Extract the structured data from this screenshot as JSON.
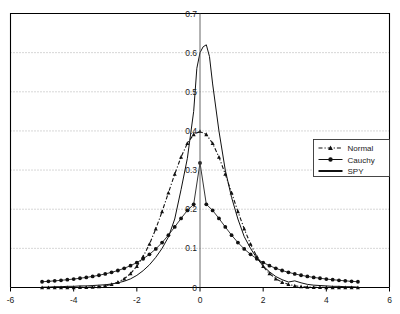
{
  "chart_data": {
    "type": "line",
    "title": "",
    "subtitle": "",
    "xlabel": "",
    "ylabel": "",
    "xlim": [
      -6,
      6
    ],
    "ylim": [
      0,
      0.7
    ],
    "xticks": [
      "-6",
      "-4",
      "-2",
      "0",
      "2",
      "4",
      "6"
    ],
    "xtick_values": [
      -6,
      -4,
      -2,
      0,
      2,
      4,
      6
    ],
    "yticks": [
      "0",
      "0.1",
      "0.2",
      "0.3",
      "0.4",
      "0.5",
      "0.6",
      "0.7"
    ],
    "ytick_values": [
      0,
      0.1,
      0.2,
      0.3,
      0.4,
      0.5,
      0.6,
      0.7
    ],
    "grid": "horizontal-dotted",
    "legend_position": "right",
    "legend_entries": [
      "Normal",
      "Cauchy",
      "SPY"
    ],
    "series": [
      {
        "name": "Normal",
        "style": "dash-dot-with-triangle-markers",
        "x": [
          -5.0,
          -4.8,
          -4.6,
          -4.4,
          -4.2,
          -4.0,
          -3.8,
          -3.6,
          -3.4,
          -3.2,
          -3.0,
          -2.8,
          -2.6,
          -2.4,
          -2.2,
          -2.0,
          -1.8,
          -1.6,
          -1.4,
          -1.2,
          -1.0,
          -0.8,
          -0.6,
          -0.4,
          -0.2,
          0.0,
          0.2,
          0.4,
          0.6,
          0.8,
          1.0,
          1.2,
          1.4,
          1.6,
          1.8,
          2.0,
          2.2,
          2.4,
          2.6,
          2.8,
          3.0,
          3.2,
          3.4,
          3.6,
          3.8,
          4.0,
          4.2,
          4.4,
          4.6,
          4.8,
          5.0
        ],
        "y": [
          1e-06,
          3e-06,
          6e-06,
          1.5e-05,
          3.3e-05,
          6.7e-05,
          0.00029,
          0.0006,
          0.0012,
          0.0024,
          0.0044,
          0.0079,
          0.0136,
          0.0224,
          0.0355,
          0.054,
          0.079,
          0.1109,
          0.1497,
          0.1942,
          0.242,
          0.2897,
          0.3332,
          0.3683,
          0.391,
          0.3989,
          0.391,
          0.3683,
          0.3332,
          0.2897,
          0.242,
          0.1942,
          0.1497,
          0.1109,
          0.079,
          0.054,
          0.0355,
          0.0224,
          0.0136,
          0.0079,
          0.0044,
          0.0024,
          0.0012,
          0.0006,
          0.00029,
          0.000134,
          6.7e-05,
          3.3e-05,
          1.5e-05,
          6e-06,
          3e-06
        ]
      },
      {
        "name": "Cauchy",
        "style": "solid-with-filled-circle-markers",
        "x": [
          -5.0,
          -4.8,
          -4.6,
          -4.4,
          -4.2,
          -4.0,
          -3.8,
          -3.6,
          -3.4,
          -3.2,
          -3.0,
          -2.8,
          -2.6,
          -2.4,
          -2.2,
          -2.0,
          -1.8,
          -1.6,
          -1.4,
          -1.2,
          -1.0,
          -0.8,
          -0.6,
          -0.4,
          -0.2,
          0.0,
          0.2,
          0.4,
          0.6,
          0.8,
          1.0,
          1.2,
          1.4,
          1.6,
          1.8,
          2.0,
          2.2,
          2.4,
          2.6,
          2.8,
          3.0,
          3.2,
          3.4,
          3.6,
          3.8,
          4.0,
          4.2,
          4.4,
          4.6,
          4.8,
          5.0
        ],
        "y": [
          0.0147,
          0.0158,
          0.017,
          0.0184,
          0.0199,
          0.0216,
          0.0236,
          0.0258,
          0.0283,
          0.0313,
          0.0347,
          0.0387,
          0.0434,
          0.049,
          0.0558,
          0.0637,
          0.0733,
          0.0848,
          0.0985,
          0.1148,
          0.1337,
          0.1547,
          0.1765,
          0.1969,
          0.2126,
          0.3183,
          0.2126,
          0.1969,
          0.1765,
          0.1547,
          0.1337,
          0.1148,
          0.0985,
          0.0848,
          0.0733,
          0.0637,
          0.0558,
          0.049,
          0.0434,
          0.0387,
          0.0347,
          0.0313,
          0.0283,
          0.0258,
          0.0236,
          0.0216,
          0.0199,
          0.0184,
          0.017,
          0.0158,
          0.0147
        ]
      },
      {
        "name": "SPY",
        "style": "solid-thin-line",
        "x": [
          -5.0,
          -4.8,
          -4.6,
          -4.4,
          -4.2,
          -4.0,
          -3.8,
          -3.6,
          -3.4,
          -3.2,
          -3.0,
          -2.8,
          -2.6,
          -2.4,
          -2.2,
          -2.0,
          -1.8,
          -1.6,
          -1.4,
          -1.2,
          -1.0,
          -0.8,
          -0.6,
          -0.4,
          -0.2,
          -0.1,
          0.0,
          0.1,
          0.2,
          0.3,
          0.4,
          0.6,
          0.8,
          1.0,
          1.2,
          1.4,
          1.6,
          1.8,
          2.0,
          2.2,
          2.4,
          2.6,
          2.8,
          3.0,
          3.2,
          3.4,
          3.6,
          3.8,
          4.0,
          4.2,
          4.4,
          4.6,
          4.8,
          5.0
        ],
        "y": [
          0.001,
          0.001,
          0.002,
          0.002,
          0.003,
          0.003,
          0.004,
          0.004,
          0.005,
          0.006,
          0.007,
          0.009,
          0.012,
          0.016,
          0.022,
          0.031,
          0.043,
          0.058,
          0.077,
          0.1,
          0.129,
          0.175,
          0.25,
          0.33,
          0.45,
          0.56,
          0.6,
          0.615,
          0.62,
          0.59,
          0.52,
          0.4,
          0.3,
          0.23,
          0.175,
          0.13,
          0.1,
          0.075,
          0.055,
          0.04,
          0.028,
          0.02,
          0.014,
          0.017,
          0.012,
          0.008,
          0.006,
          0.005,
          0.004,
          0.003,
          0.003,
          0.002,
          0.002,
          0.001
        ]
      }
    ]
  },
  "legend": {
    "items": [
      {
        "label": "Normal",
        "marker": "triangle",
        "line": "dash-dot"
      },
      {
        "label": "Cauchy",
        "marker": "circle",
        "line": "solid"
      },
      {
        "label": "SPY",
        "marker": "none",
        "line": "solid"
      }
    ]
  },
  "colors": {
    "axis": "#000000",
    "grid": "#9a9a9a",
    "series": "#111111",
    "background": "#ffffff"
  }
}
